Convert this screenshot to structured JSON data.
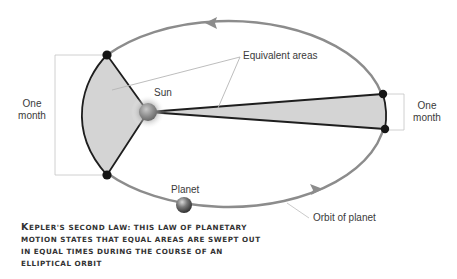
{
  "diagram": {
    "title": "Kepler's second law",
    "labels": {
      "equivalent_areas": "Equivalent areas",
      "sun": "Sun",
      "planet": "Planet",
      "orbit": "Orbit of planet",
      "left_duration_line1": "One",
      "left_duration_line2": "month",
      "right_duration_line1": "One",
      "right_duration_line2": "month"
    },
    "caption": {
      "first_letter": "K",
      "rest": "epler's second law: this law of planetary motion states that equal areas are swept out in equal times during the course of an elliptical orbit"
    },
    "colors": {
      "orbit": "#8c8c8c",
      "sector_fill": "#d4d4d4",
      "sector_stroke": "#1e1e1e",
      "leader": "#b5b5b5",
      "dot": "#151515"
    }
  }
}
